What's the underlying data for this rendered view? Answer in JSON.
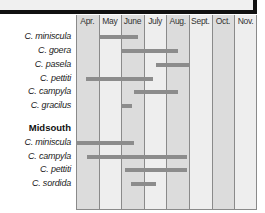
{
  "chart_data": {
    "type": "gantt",
    "title": "",
    "xlabel": "",
    "ylabel": "",
    "categories": [
      "Apr.",
      "May",
      "June",
      "July",
      "Aug.",
      "Sept.",
      "Oct.",
      "Nov."
    ],
    "groups": [
      {
        "name": "",
        "rows": [
          {
            "label": "C. miniscula",
            "start": 1.0,
            "end": 2.75
          },
          {
            "label": "C. goera",
            "start": 2.0,
            "end": 4.5
          },
          {
            "label": "C. pasela",
            "start": 3.55,
            "end": 5.0
          },
          {
            "label": "C. pettiti",
            "start": 0.45,
            "end": 3.42
          },
          {
            "label": "C. campyla",
            "start": 2.55,
            "end": 4.5
          },
          {
            "label": "C. gracilus",
            "start": 2.0,
            "end": 2.5
          }
        ]
      },
      {
        "name": "Midsouth",
        "rows": [
          {
            "label": "C. miniscula",
            "start": 0.0,
            "end": 2.55
          },
          {
            "label": "C. campyla",
            "start": 0.48,
            "end": 4.9
          },
          {
            "label": "C. pettiti",
            "start": 2.15,
            "end": 4.9
          },
          {
            "label": "C. sordida",
            "start": 2.45,
            "end": 3.55
          }
        ]
      }
    ],
    "units": "month index from start of Apr. (0) to end of Nov. (8)",
    "grid": true,
    "legend": "none",
    "colors": {
      "bar": "#8c8c8c",
      "col_dark": "#dcdcdc",
      "col_light": "#eeeeee"
    }
  }
}
